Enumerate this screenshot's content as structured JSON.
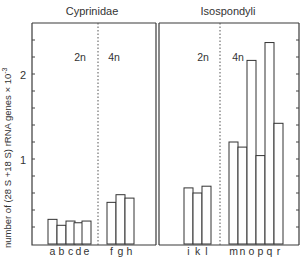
{
  "chart_data": {
    "type": "bar",
    "title": "",
    "xlabel": "",
    "ylabel": "number of (28 S +18 S) rRNA genes × 10⁻³",
    "ylim": [
      0,
      2.6
    ],
    "yticks": [
      1,
      2
    ],
    "minor_tick_step": 0.2,
    "grid": false,
    "legend": null,
    "groups": [
      {
        "name": "Cyprinidae",
        "subgroups": [
          {
            "label": "2n",
            "categories": [
              "a",
              "b",
              "c",
              "d",
              "e"
            ],
            "values": [
              0.29,
              0.22,
              0.27,
              0.25,
              0.27
            ]
          },
          {
            "label": "4n",
            "categories": [
              "f",
              "g",
              "h"
            ],
            "values": [
              0.49,
              0.58,
              0.54
            ]
          }
        ]
      },
      {
        "name": "Isospondyli",
        "subgroups": [
          {
            "label": "2n",
            "categories": [
              "i",
              "k",
              "l"
            ],
            "values": [
              0.66,
              0.6,
              0.68
            ]
          },
          {
            "label": "4n",
            "categories": [
              "m",
              "n",
              "o",
              "p",
              "q",
              "r"
            ],
            "values": [
              1.2,
              1.14,
              2.16,
              1.04,
              2.37,
              1.42
            ]
          }
        ]
      }
    ],
    "categories": [
      "a",
      "b",
      "c",
      "d",
      "e",
      "f",
      "g",
      "h",
      "i",
      "k",
      "l",
      "m",
      "n",
      "o",
      "p",
      "q",
      "r"
    ],
    "values": [
      0.29,
      0.22,
      0.27,
      0.25,
      0.27,
      0.49,
      0.58,
      0.54,
      0.66,
      0.6,
      0.68,
      1.2,
      1.14,
      2.16,
      1.04,
      2.37,
      1.42
    ]
  },
  "labels": {
    "group_left": "Cyprinidae",
    "group_right": "Isospondyli",
    "ploidy_2n": "2n",
    "ploidy_4n": "4n",
    "ytick_1": "1",
    "ytick_2": "2",
    "ylabel": "number of (28 S +18 S) rRNA genes × 10",
    "ylabel_exp": "-3"
  },
  "layout": {
    "baseline_y": 244,
    "px_per_unit": 85,
    "bar_x": [
      48,
      57,
      66,
      74,
      82,
      107,
      116,
      125,
      184,
      193,
      202,
      229,
      238,
      247,
      256,
      265,
      274
    ],
    "bar_w": 9
  }
}
